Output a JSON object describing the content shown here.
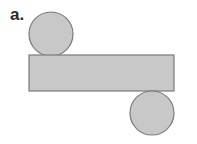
{
  "figure": {
    "label": "a.",
    "colors": {
      "fill": "#c8c8c8",
      "stroke": "#7a7a7a"
    },
    "shapes": [
      {
        "name": "top-circle",
        "type": "circle"
      },
      {
        "name": "lateral-rectangle",
        "type": "rectangle"
      },
      {
        "name": "bottom-circle",
        "type": "circle"
      }
    ]
  }
}
